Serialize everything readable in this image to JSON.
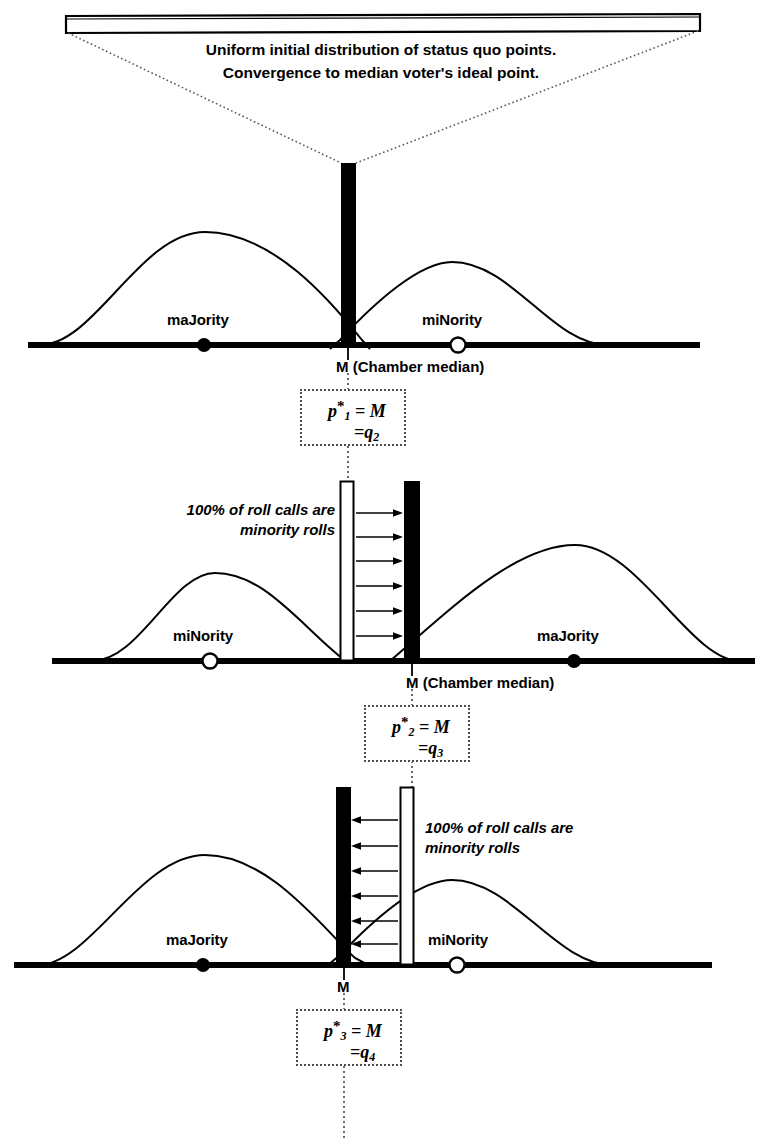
{
  "figure": {
    "caption": {
      "line1": "Uniform initial distribution of status quo points.",
      "line2": "Convergence to median voter's ideal point."
    },
    "panels": [
      {
        "id": "panel-1",
        "majority_label": "maJority",
        "minority_label": "miNority",
        "median_label": "M  (Chamber median)",
        "rollcall_note": null,
        "equation": {
          "line1_p": "p",
          "line1_star": "*",
          "line1_sub": "1",
          "line1_rest": " = M",
          "line2_eq": "=q",
          "line2_sub": "2"
        }
      },
      {
        "id": "panel-2",
        "majority_label": "maJority",
        "minority_label": "miNority",
        "median_label": "M (Chamber median)",
        "rollcall_note": {
          "line1": "100% of roll calls are",
          "line2": "minority rolls",
          "align": "right"
        },
        "equation": {
          "line1_p": "p",
          "line1_star": "*",
          "line1_sub": "2",
          "line1_rest": " = M",
          "line2_eq": "=q",
          "line2_sub": "3"
        }
      },
      {
        "id": "panel-3",
        "majority_label": "maJority",
        "minority_label": "miNority",
        "median_label": "M",
        "rollcall_note": {
          "line1": "100% of roll calls are",
          "line2": "minority rolls",
          "align": "left"
        },
        "equation": {
          "line1_p": "p",
          "line1_star": "*",
          "line1_sub": "3",
          "line1_rest": " = M",
          "line2_eq": "=q",
          "line2_sub": "4"
        }
      }
    ],
    "colors": {
      "ink": "#000000",
      "dotted": "#4d4d4d",
      "status_quo_fill": "#000000",
      "proposal_fill": "#ffffff"
    },
    "glyphs": {
      "majority_marker": "filled-circle",
      "minority_marker": "open-circle",
      "arrow_right": "arrow-right",
      "arrow_left": "arrow-left"
    }
  }
}
